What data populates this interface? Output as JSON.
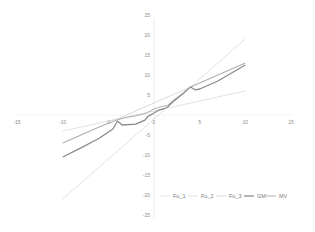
{
  "chart_data": {
    "type": "scatter",
    "title": "",
    "xlabel": "",
    "ylabel": "",
    "xlim": [
      -15,
      15
    ],
    "ylim": [
      -25,
      25
    ],
    "x_ticks": [
      -15,
      -10,
      -5,
      0,
      5,
      10,
      15
    ],
    "y_ticks": [
      25,
      20,
      15,
      10,
      5,
      -5,
      -10,
      -15,
      -20,
      -25
    ],
    "grid": false,
    "legend_position": "bottom-right",
    "series": [
      {
        "name": "Fu_1",
        "color": "#d9d9d9",
        "width": 0.8,
        "x": [
          -10,
          10
        ],
        "y": [
          -21,
          19
        ]
      },
      {
        "name": "Fu_2",
        "color": "#d9d9d9",
        "width": 0.8,
        "x": [
          -10,
          10
        ],
        "y": [
          -4,
          6
        ]
      },
      {
        "name": "Fu_3",
        "color": "#cfcfcf",
        "width": 0.8,
        "x": [
          -10,
          10
        ],
        "y": [
          -7,
          13
        ]
      },
      {
        "name": "GM",
        "color": "#8a8a8a",
        "width": 1.3,
        "x": [
          -10,
          -8,
          -6,
          -4.5,
          -4,
          -3.5,
          -2,
          -1,
          -0.7,
          0,
          0.5,
          1,
          1.5,
          2,
          3,
          4,
          4.5,
          5,
          7,
          10
        ],
        "y": [
          -10.5,
          -8.2,
          -5.8,
          -3.5,
          -1.5,
          -2.5,
          -2.3,
          -1.3,
          -0.4,
          0.5,
          1.2,
          1.5,
          2.0,
          3.2,
          5.0,
          7.0,
          6.3,
          6.5,
          8.5,
          12.5
        ]
      },
      {
        "name": "MV",
        "color": "#a6a6a6",
        "width": 0.9,
        "x": [
          -10,
          -8,
          -6,
          -4,
          -3,
          -2,
          -1,
          -0.5,
          0,
          0.5,
          1,
          1.5,
          2,
          3,
          4,
          5,
          7,
          10
        ],
        "y": [
          -7,
          -5,
          -3,
          -1.2,
          -0.6,
          -0.2,
          0.3,
          0.9,
          1.5,
          1.9,
          2.2,
          2.4,
          3.5,
          5.2,
          7.0,
          8.0,
          10.0,
          13.0
        ]
      }
    ]
  }
}
